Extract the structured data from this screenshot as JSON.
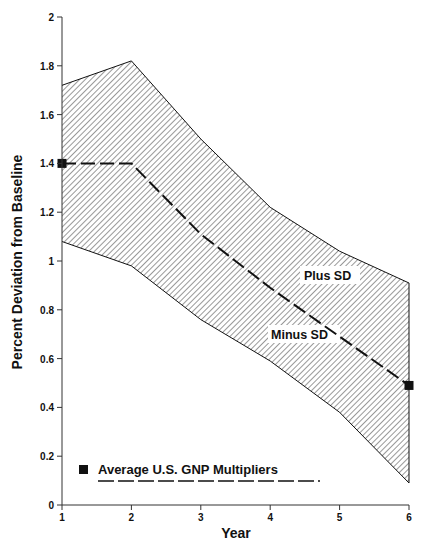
{
  "chart_data": {
    "type": "area",
    "title": "",
    "xlabel": "Year",
    "ylabel": "Percent Deviation from Baseline",
    "x": [
      1,
      2,
      3,
      4,
      5,
      6
    ],
    "xlim": [
      1,
      6
    ],
    "ylim": [
      0,
      2
    ],
    "xticks": [
      "1",
      "2",
      "3",
      "4",
      "5",
      "6"
    ],
    "yticks": [
      "0",
      "0.2",
      "0.4",
      "0.6",
      "0.8",
      "1",
      "1.2",
      "1.4",
      "1.6",
      "1.8",
      "2"
    ],
    "grid": false,
    "series": [
      {
        "name": "Plus SD",
        "values": [
          1.72,
          1.82,
          1.5,
          1.22,
          1.04,
          0.91
        ]
      },
      {
        "name": "Average U.S. GNP Multipliers",
        "values": [
          1.4,
          1.4,
          1.11,
          0.89,
          0.69,
          0.49
        ],
        "style": "dashed",
        "markers_at": [
          1,
          6
        ]
      },
      {
        "name": "Minus SD",
        "values": [
          1.08,
          0.98,
          0.76,
          0.59,
          0.38,
          0.09
        ]
      }
    ],
    "band": {
      "upper": "Plus SD",
      "lower": "Minus SD",
      "fill": "diagonal-hatch"
    },
    "annotations": [
      {
        "text": "Plus SD",
        "x": 5.25,
        "y": 0.97
      },
      {
        "text": "Minus SD",
        "x": 4.7,
        "y": 0.71
      }
    ],
    "legend": {
      "position": "lower-left",
      "entries": [
        "Average U.S. GNP Multipliers"
      ]
    }
  },
  "labels": {
    "xlabel": "Year",
    "ylabel": "Percent Deviation from Baseline",
    "plus_sd": "Plus SD",
    "minus_sd": "Minus SD",
    "legend": "Average U.S. GNP Multipliers",
    "xticks": [
      "1",
      "2",
      "3",
      "4",
      "5",
      "6"
    ],
    "yticks": [
      "0",
      "0.2",
      "0.4",
      "0.6",
      "0.8",
      "1",
      "1.2",
      "1.4",
      "1.6",
      "1.8",
      "2"
    ]
  },
  "colors": {
    "ink": "#111111",
    "hatch": "#333333",
    "background": "#ffffff"
  }
}
